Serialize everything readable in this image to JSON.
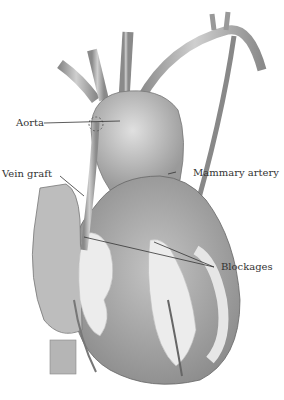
{
  "diagram": {
    "labels": {
      "aorta": "Aorta",
      "vein_graft": "Vein graft",
      "mammary_artery": "Mammary artery",
      "blockages": "Blockages"
    },
    "colors": {
      "background": "#ffffff",
      "tissue": "#a8a8a8",
      "tissue_dark": "#7a7a7a",
      "fat": "#e8e8e8",
      "leader_line": "#333333",
      "label_text": "#333333"
    }
  }
}
